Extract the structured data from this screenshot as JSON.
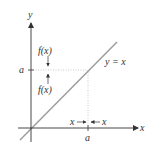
{
  "diagram": {
    "axis_x_label": "x",
    "axis_y_label": "y",
    "line_label": "y = x",
    "y_tick_label": "a",
    "x_tick_label": "a",
    "fx_upper_label": "f(x)",
    "fx_lower_label": "f(x)",
    "x_left_label": "x",
    "x_right_label": "x",
    "colors": {
      "axis": "#333333",
      "diagonal": "#9a9a9a",
      "dotted": "#bbbbbb",
      "text": "#333333"
    }
  }
}
